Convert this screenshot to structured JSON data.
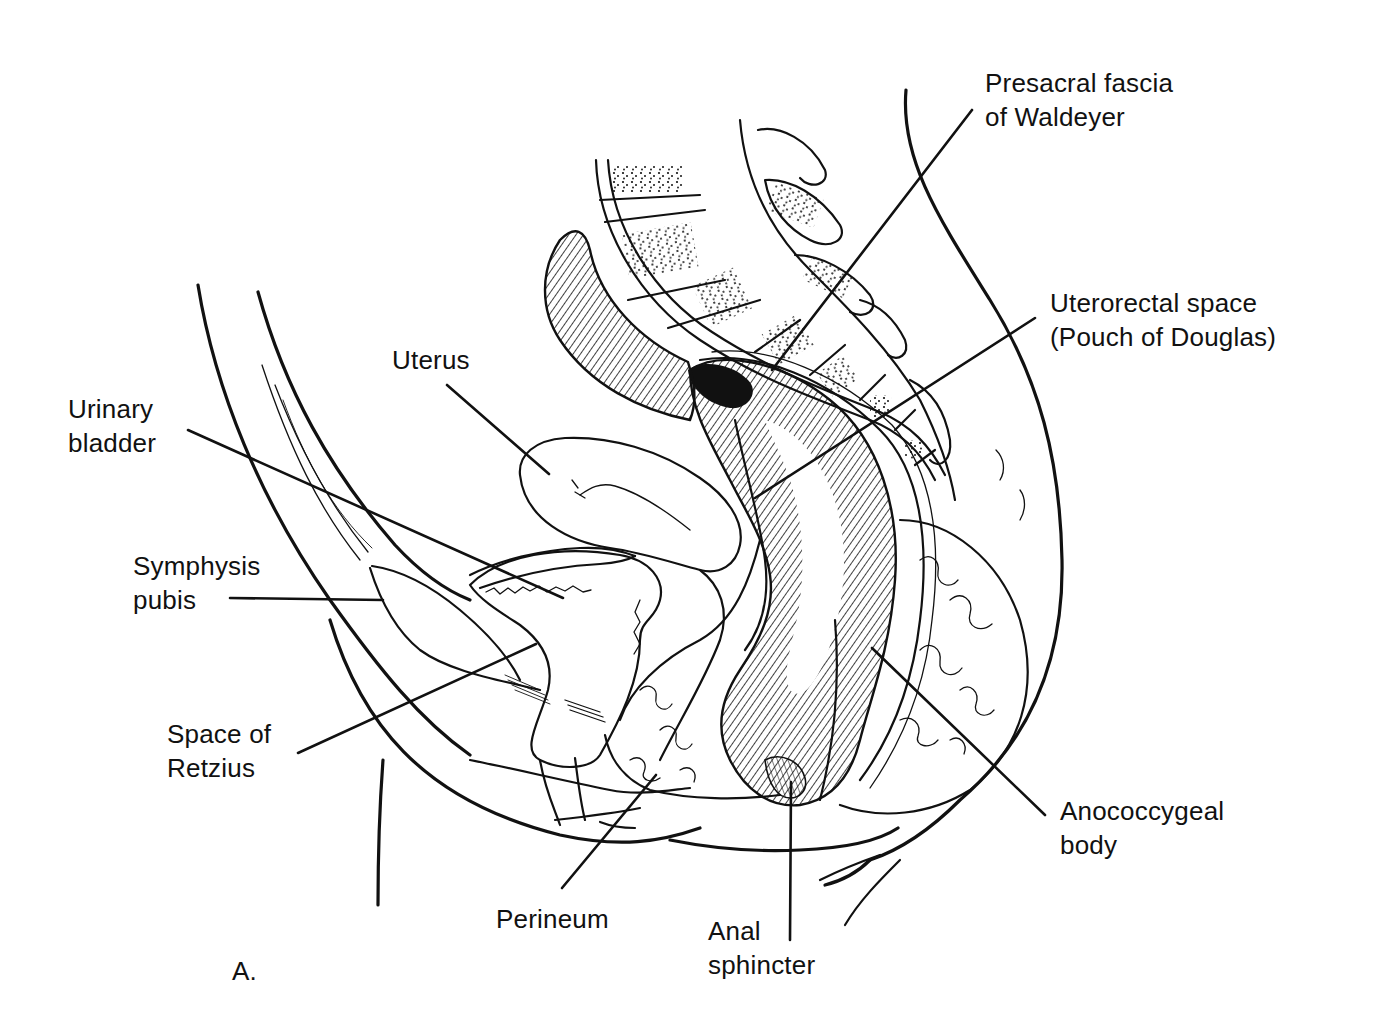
{
  "figure": {
    "panel_label": "A.",
    "ink_color": "#111111",
    "background_color": "#ffffff"
  },
  "labels": {
    "presacral_fascia": {
      "line1": "Presacral fascia",
      "line2": "of Waldeyer"
    },
    "uterorectal_space": {
      "line1": "Uterorectal space",
      "line2": "(Pouch of Douglas)"
    },
    "uterus": {
      "line1": "Uterus"
    },
    "urinary_bladder": {
      "line1": "Urinary",
      "line2": "bladder"
    },
    "symphysis_pubis": {
      "line1": "Symphysis",
      "line2": "pubis"
    },
    "space_of_retzius": {
      "line1": "Space of",
      "line2": "Retzius"
    },
    "perineum": {
      "line1": "Perineum"
    },
    "anal_sphincter": {
      "line1": "Anal",
      "line2": "sphincter"
    },
    "anococcygeal_body": {
      "line1": "Anococcygeal",
      "line2": "body"
    }
  }
}
